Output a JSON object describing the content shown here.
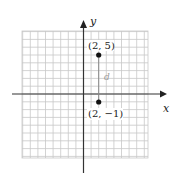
{
  "figure": {
    "axes": {
      "x_label": "x",
      "y_label": "y",
      "grid": true
    },
    "points": [
      {
        "label": "(2, 5)",
        "x": 2,
        "y": 5
      },
      {
        "label": "(2, −1)",
        "x": 2,
        "y": -1
      }
    ],
    "segment_label": "d",
    "colors": {
      "grid": "#c8c8c8",
      "axis": "#333333",
      "point": "#111111",
      "segment": "#888888",
      "segment_label": "#9a9a9a"
    }
  }
}
